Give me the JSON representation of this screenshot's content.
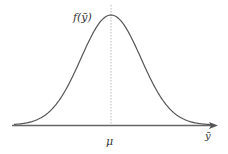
{
  "chart_data": {
    "type": "line",
    "title": "",
    "ylabel": "f(ȳ)",
    "xlabel": "ȳ",
    "tick_labels": [
      "μ"
    ],
    "mean_marker": "μ",
    "series": [
      {
        "name": "f(ȳ)",
        "distribution": "normal",
        "mean_position": "μ"
      }
    ],
    "grid": false,
    "legend": null,
    "colors": {
      "curve": "#555555",
      "axis": "#666666",
      "mean_line": "#aaaaaa"
    }
  },
  "labels": {
    "curve": "f(ȳ)",
    "mean": "μ",
    "axis": "ȳ"
  }
}
